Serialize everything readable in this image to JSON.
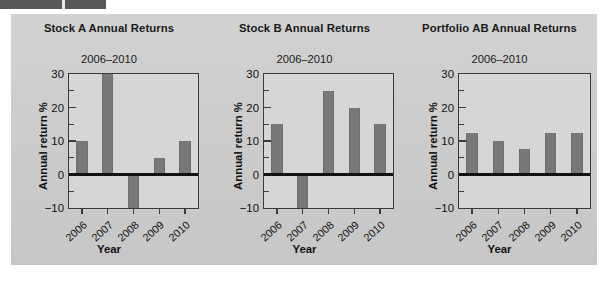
{
  "figure": {
    "background_color": "#cfcfcf",
    "marker_color": "#555759",
    "bar_color": "#787878",
    "axis_color": "#3a3a3a"
  },
  "axis": {
    "xlabel": "Year",
    "ylabel": "Annual return %",
    "ytick_labels": [
      "30",
      "20",
      "10",
      "0",
      "−10"
    ],
    "ytick_values": [
      30,
      20,
      10,
      0,
      -10
    ],
    "yminor_values": [
      25,
      15,
      5,
      -5
    ],
    "categories": [
      "2006",
      "2007",
      "2008",
      "2009",
      "2010"
    ]
  },
  "chart_data": [
    {
      "type": "bar",
      "title": "Stock A Annual Returns",
      "subtitle": "2006–2010",
      "xlabel": "Year",
      "ylabel": "Annual return %",
      "categories": [
        "2006",
        "2007",
        "2008",
        "2009",
        "2010"
      ],
      "values": [
        10,
        30,
        -10,
        5,
        10
      ],
      "ylim": [
        -10,
        30
      ],
      "yticks": [
        -10,
        0,
        10,
        20,
        30
      ],
      "grid": false,
      "legend": "none",
      "note": "2007 bar is clipped at the top of the axis (>= 30); 2008 bar is clipped at the bottom (<= -10)"
    },
    {
      "type": "bar",
      "title": "Stock B Annual Returns",
      "subtitle": "2006–2010",
      "xlabel": "Year",
      "ylabel": "Annual return %",
      "categories": [
        "2006",
        "2007",
        "2008",
        "2009",
        "2010"
      ],
      "values": [
        15,
        -10,
        25,
        20,
        15
      ],
      "ylim": [
        -10,
        30
      ],
      "yticks": [
        -10,
        0,
        10,
        20,
        30
      ],
      "grid": false,
      "legend": "none",
      "note": "2007 bar is clipped at the bottom of the axis (<= -10)"
    },
    {
      "type": "bar",
      "title": "Portfolio AB Annual Returns",
      "subtitle": "2006–2010",
      "xlabel": "Year",
      "ylabel": "Annual return %",
      "categories": [
        "2006",
        "2007",
        "2008",
        "2009",
        "2010"
      ],
      "values": [
        12.5,
        10,
        7.5,
        12.5,
        12.5
      ],
      "ylim": [
        -10,
        30
      ],
      "yticks": [
        -10,
        0,
        10,
        20,
        30
      ],
      "grid": false,
      "legend": "none"
    }
  ]
}
